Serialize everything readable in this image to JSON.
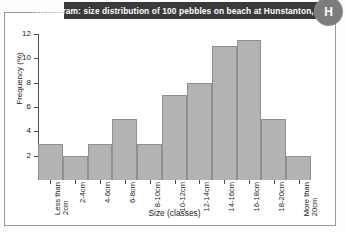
{
  "banner": {
    "title": "Histogram: size distribution of 100 pebbles on beach at Hunstanton, Norfolk",
    "badge_letter": "H",
    "background_color": "#3a3a3a",
    "text_color": "#ffffff"
  },
  "chart_data": {
    "type": "bar",
    "title": "Histogram: size distribution of 100 pebbles on beach at Hunstanton, Norfolk",
    "xlabel": "Size (classes)",
    "ylabel": "Frequency (%)",
    "categories": [
      "Less than\n2cm",
      "2-4cm",
      "4-6cm",
      "6-8cm",
      "8-10cm",
      "10-12cm",
      "12-14cm",
      "14-16cm",
      "16-18cm",
      "18-20cm",
      "More than\n20cm"
    ],
    "values": [
      3,
      2,
      3,
      5,
      3,
      7,
      8,
      11,
      11.5,
      5,
      2
    ],
    "ylim": [
      0,
      12
    ],
    "yticks": [
      2,
      4,
      6,
      8,
      10,
      12
    ],
    "grid": false,
    "legend": "none",
    "bar_fill_color": "#b3b3b3",
    "bar_edge_color": "#8f8f8f",
    "axis_color": "#4d4d4d"
  }
}
